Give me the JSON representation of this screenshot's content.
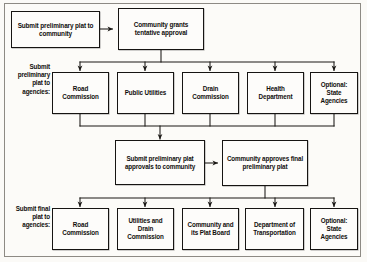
{
  "diagram": {
    "colors": {
      "background": "#fbfaf7",
      "box_border": "#161412",
      "box_fill": "#fdfcfa",
      "line": "#1a1815",
      "text": "#100e0c",
      "frame": "#8d8a84"
    },
    "side_labels": [
      {
        "id": "label-preliminary-agencies",
        "text": "Submit preliminary plat to agencies:"
      },
      {
        "id": "label-final-agencies",
        "text": "Submit final plat to agencies:"
      }
    ],
    "rows": {
      "row1": {
        "name": "initial-submission",
        "nodes": [
          {
            "id": "submit-preliminary-plat-to-community",
            "text": "Submit preliminary plat to community"
          },
          {
            "id": "community-grants-tentative-approval",
            "text": "Community grants tentative approval"
          }
        ]
      },
      "row2": {
        "name": "preliminary-agencies",
        "nodes": [
          {
            "id": "road-commission-preliminary",
            "text": "Road Commission"
          },
          {
            "id": "public-utilities",
            "text": "Public Utilities"
          },
          {
            "id": "drain-commission",
            "text": "Drain Commission"
          },
          {
            "id": "health-department",
            "text": "Health Department"
          },
          {
            "id": "optional-state-agencies-preliminary",
            "text": "Optional: State Agencies"
          }
        ]
      },
      "row3": {
        "name": "approvals-returned",
        "nodes": [
          {
            "id": "submit-preliminary-plat-approvals-to-community",
            "text": "Submit preliminary plat approvals to community"
          },
          {
            "id": "community-approves-final-preliminary-plat",
            "text": "Community approves final preliminary plat"
          }
        ]
      },
      "row4": {
        "name": "final-agencies",
        "nodes": [
          {
            "id": "road-commission-final",
            "text": "Road Commission"
          },
          {
            "id": "utilities-and-drain-commission",
            "text": "Utilities and Drain Commission"
          },
          {
            "id": "community-and-its-plat-board",
            "text": "Community and its Plat Board"
          },
          {
            "id": "department-of-transportation",
            "text": "Department of Transportation"
          },
          {
            "id": "optional-state-agencies-final",
            "text": "Optional: State Agencies"
          }
        ]
      }
    }
  }
}
